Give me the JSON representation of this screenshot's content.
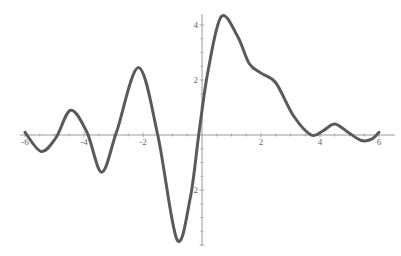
{
  "chart_data": {
    "type": "line",
    "title": "",
    "xlabel": "",
    "ylabel": "",
    "xlim": [
      -6.2,
      6.5
    ],
    "ylim": [
      -4.0,
      4.3
    ],
    "grid": false,
    "legend": null,
    "x_ticks": [
      -6,
      -4,
      -2,
      2,
      4,
      6
    ],
    "x_tick_labels": [
      "-6",
      "-4",
      "-2",
      "2",
      "4",
      "6"
    ],
    "y_ticks": [
      -2,
      2,
      4
    ],
    "y_tick_labels": [
      "-2",
      "2",
      "4"
    ],
    "series": [
      {
        "name": "f(x)",
        "color": "#5a5a5a",
        "x": [
          -6.0,
          -5.45,
          -4.95,
          -4.45,
          -3.9,
          -3.4,
          -2.9,
          -2.15,
          -1.5,
          -0.85,
          -0.4,
          -0.1,
          0.2,
          0.65,
          1.2,
          1.6,
          2.0,
          2.5,
          3.1,
          3.7,
          4.1,
          4.5,
          4.95,
          5.4,
          5.75,
          6.0
        ],
        "y": [
          0.1,
          -0.6,
          -0.1,
          0.9,
          0.1,
          -1.35,
          0.1,
          2.45,
          0.0,
          -3.8,
          -2.3,
          0.1,
          2.3,
          4.3,
          3.6,
          2.6,
          2.25,
          1.9,
          0.7,
          0.0,
          0.15,
          0.4,
          0.1,
          -0.2,
          -0.15,
          0.1
        ]
      }
    ]
  },
  "axes": {
    "axis_color": "#9a9a9a"
  }
}
